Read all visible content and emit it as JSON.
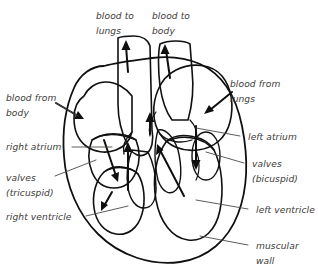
{
  "figure": {
    "background_color": "#ffffff"
  },
  "colors": {
    "deoxygenated_blood": "#6f77a6",
    "oxygenated_blood": "#cc5640",
    "muscular_wall": "#dcd9cf",
    "outline": "#111010",
    "label_text": "#3b3a38",
    "leader_line": "#4a4a48",
    "arrow": "#100f0e"
  },
  "labels": {
    "blood_to_lungs": "blood to\nlungs",
    "blood_to_lungs_line1": "blood to",
    "blood_to_lungs_line2": "lungs",
    "blood_to_body_line1": "blood to",
    "blood_to_body_line2": "body",
    "blood_from_body_line1": "blood from",
    "blood_from_body_line2": "body",
    "blood_from_lungs_line1": "blood from",
    "blood_from_lungs_line2": "lungs",
    "right_atrium": "right atrium",
    "left_atrium": "left atrium",
    "valves_tricuspid_line1": "valves",
    "valves_tricuspid_line2": "(tricuspid)",
    "valves_bicuspid_line1": "valves",
    "valves_bicuspid_line2": "(bicuspid)",
    "right_ventricle": "right ventricle",
    "left_ventricle": "left ventricle",
    "muscular_wall_line1": "muscular",
    "muscular_wall_line2": "wall"
  }
}
